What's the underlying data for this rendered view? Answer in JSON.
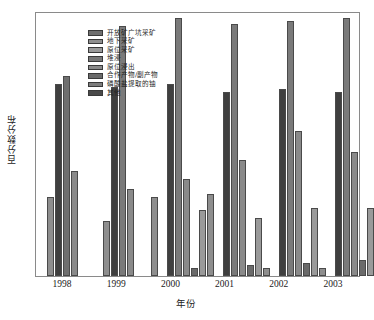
{
  "chart_data": {
    "type": "bar",
    "title": "",
    "xlabel": "年份",
    "ylabel": "百分数分布",
    "categories": [
      "1998",
      "1999",
      "2000",
      "2001",
      "2002",
      "2003"
    ],
    "ylim": [
      0,
      100
    ],
    "grid": false,
    "legend_position": "top-left-inside",
    "series": [
      {
        "name": "开放矿广坑采矿",
        "color": "#6e6e6e",
        "values": [
          0,
          43,
          33,
          30,
          31,
          30
        ]
      },
      {
        "name": "地下采矿",
        "color": "#3c3c3c",
        "values": [
          73,
          72,
          0,
          0,
          0,
          0
        ]
      },
      {
        "name": "原位采矿",
        "color": "#7a7a7a",
        "values": [
          76,
          0,
          95,
          98,
          96,
          97
        ]
      },
      {
        "name": "堆浸",
        "color": "#555555",
        "values": [
          0,
          0,
          0,
          23,
          46,
          0
        ]
      },
      {
        "name": "原位浸出",
        "color": "#9a9a9a",
        "values": [
          40,
          21,
          33,
          12,
          3,
          44
        ]
      },
      {
        "name": "合作产物/副产物",
        "color": "#6a6a6a",
        "values": [
          0,
          0,
          0,
          0,
          0,
          0
        ]
      },
      {
        "name": "磷酸盐提取的铀",
        "color": "#8f8f8f",
        "values": [
          0,
          0,
          3,
          2,
          10,
          3
        ]
      },
      {
        "name": "其他",
        "color": "#4a4a4a",
        "values": [
          0,
          0,
          0,
          0,
          0,
          0
        ]
      }
    ],
    "groups": [
      {
        "year": "1998",
        "bars": [
          {
            "series": "开放矿广坑采矿",
            "value": 0,
            "color": "#6e6e6e"
          },
          {
            "series": "地下采矿",
            "value": 30,
            "color": "#8e8e8e"
          },
          {
            "series": "原位采矿",
            "value": 73,
            "color": "#3f3f3f"
          },
          {
            "series": "堆浸",
            "value": 76,
            "color": "#6f6f6f"
          },
          {
            "series": "原位浸出",
            "value": 40,
            "color": "#8a8a8a"
          },
          {
            "series": "合作产物/副产物",
            "value": 0,
            "color": "#6a6a6a"
          },
          {
            "series": "磷酸盐提取的铀",
            "value": 0,
            "color": "#9a9a9a"
          }
        ]
      },
      {
        "year": "1999",
        "bars": [
          {
            "series": "开放矿广坑采矿",
            "value": 0,
            "color": "#6e6e6e"
          },
          {
            "series": "地下采矿",
            "value": 21,
            "color": "#8e8e8e"
          },
          {
            "series": "原位采矿",
            "value": 72,
            "color": "#3f3f3f"
          },
          {
            "series": "堆浸",
            "value": 95,
            "color": "#7a7a7a"
          },
          {
            "series": "原位浸出",
            "value": 33,
            "color": "#8a8a8a"
          },
          {
            "series": "合作产物/副产物",
            "value": 0,
            "color": "#6a6a6a"
          },
          {
            "series": "磷酸盐提取的铀",
            "value": 0,
            "color": "#9a9a9a"
          }
        ]
      },
      {
        "year": "2000",
        "bars": [
          {
            "series": "开放矿广坑采矿",
            "value": 30,
            "color": "#8e8e8e"
          },
          {
            "series": "地下采矿",
            "value": 0,
            "color": "#8e8e8e"
          },
          {
            "series": "原位采矿",
            "value": 73,
            "color": "#3f3f3f"
          },
          {
            "series": "堆浸",
            "value": 98,
            "color": "#7a7a7a"
          },
          {
            "series": "原位浸出",
            "value": 37,
            "color": "#8a8a8a"
          },
          {
            "series": "合作产物/副产物",
            "value": 3,
            "color": "#6a6a6a"
          },
          {
            "series": "磷酸盐提取的铀",
            "value": 25,
            "color": "#9a9a9a"
          }
        ]
      },
      {
        "year": "2001",
        "bars": [
          {
            "series": "开放矿广坑采矿",
            "value": 31,
            "color": "#8e8e8e"
          },
          {
            "series": "地下采矿",
            "value": 0,
            "color": "#8e8e8e"
          },
          {
            "series": "原位采矿",
            "value": 70,
            "color": "#3f3f3f"
          },
          {
            "series": "堆浸",
            "value": 96,
            "color": "#7a7a7a"
          },
          {
            "series": "原位浸出",
            "value": 44,
            "color": "#8a8a8a"
          },
          {
            "series": "合作产物/副产物",
            "value": 4,
            "color": "#6a6a6a"
          },
          {
            "series": "磷酸盐提取的铀",
            "value": 22,
            "color": "#9a9a9a"
          }
        ]
      },
      {
        "year": "2002",
        "bars": [
          {
            "series": "开放矿广坑采矿",
            "value": 3,
            "color": "#8e8e8e"
          },
          {
            "series": "地下采矿",
            "value": 0,
            "color": "#8e8e8e"
          },
          {
            "series": "原位采矿",
            "value": 71,
            "color": "#3f3f3f"
          },
          {
            "series": "堆浸",
            "value": 97,
            "color": "#7a7a7a"
          },
          {
            "series": "原位浸出",
            "value": 55,
            "color": "#8a8a8a"
          },
          {
            "series": "合作产物/副产物",
            "value": 5,
            "color": "#6a6a6a"
          },
          {
            "series": "磷酸盐提取的铀",
            "value": 26,
            "color": "#9a9a9a"
          }
        ]
      },
      {
        "year": "2003",
        "bars": [
          {
            "series": "开放矿广坑采矿",
            "value": 3,
            "color": "#8e8e8e"
          },
          {
            "series": "地下采矿",
            "value": 0,
            "color": "#8e8e8e"
          },
          {
            "series": "原位采矿",
            "value": 70,
            "color": "#3f3f3f"
          },
          {
            "series": "堆浸",
            "value": 98,
            "color": "#7a7a7a"
          },
          {
            "series": "原位浸出",
            "value": 47,
            "color": "#8a8a8a"
          },
          {
            "series": "合作产物/副产物",
            "value": 6,
            "color": "#6a6a6a"
          },
          {
            "series": "磷酸盐提取的铀",
            "value": 26,
            "color": "#9a9a9a"
          }
        ]
      }
    ]
  },
  "legend": {
    "items": [
      {
        "label": "开放矿广坑采矿",
        "color": "#6e6e6e"
      },
      {
        "label": "地下采矿",
        "color": "#8e8e8e"
      },
      {
        "label": "原位采矿",
        "color": "#9a9a9a"
      },
      {
        "label": "堆浸",
        "color": "#777777"
      },
      {
        "label": "原位浸出",
        "color": "#8a8a8a"
      },
      {
        "label": "合作产物/副产物",
        "color": "#6a6a6a"
      },
      {
        "label": "磷酸盐提取的铀",
        "color": "#7d7d7d"
      },
      {
        "label": "其他",
        "color": "#4a4a4a"
      }
    ]
  },
  "axes": {
    "x_title": "年份",
    "y_title": "百分数分布",
    "x_ticks": [
      "1998",
      "1999",
      "2000",
      "2001",
      "2002",
      "2003"
    ]
  }
}
